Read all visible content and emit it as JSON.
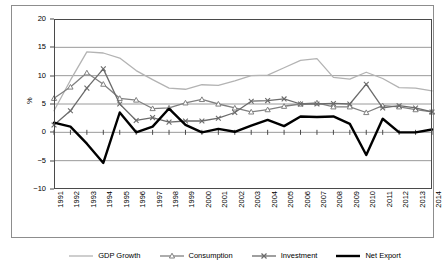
{
  "chart_data": {
    "type": "line",
    "title": "",
    "xlabel": "",
    "ylabel": "%",
    "ylim": [
      -10,
      20
    ],
    "yticks": [
      20,
      15,
      10,
      5,
      0,
      -5,
      -10
    ],
    "grid": true,
    "legend_position": "bottom",
    "categories": [
      "1991",
      "1992",
      "1993",
      "1994",
      "1995",
      "1996",
      "1997",
      "1998",
      "1999",
      "2000",
      "2001",
      "2002",
      "2003",
      "2004",
      "2005",
      "2006",
      "2007",
      "2008",
      "2009",
      "2010",
      "2011",
      "2012",
      "2013",
      "2014"
    ],
    "series": [
      {
        "name": "GDP Growth",
        "color": "#b3b3b3",
        "marker": "none",
        "values": [
          3.8,
          9.2,
          14.2,
          14.0,
          13.1,
          10.9,
          9.3,
          7.8,
          7.6,
          8.4,
          8.3,
          9.1,
          10.0,
          10.1,
          11.4,
          12.7,
          13.0,
          9.7,
          9.4,
          10.6,
          9.5,
          7.9,
          7.8,
          7.3
        ],
        "values_note": "light gray line, no markers"
      },
      {
        "name": "Consumption",
        "color": "#808080",
        "marker": "triangle",
        "values": [
          6.0,
          8.0,
          10.5,
          8.5,
          6.0,
          5.7,
          4.2,
          4.3,
          5.2,
          5.8,
          5.0,
          4.3,
          3.6,
          4.0,
          4.6,
          5.0,
          5.2,
          4.5,
          4.5,
          3.5,
          4.7,
          4.5,
          4.0,
          3.6
        ],
        "values_note": "gray line, open triangle markers"
      },
      {
        "name": "Investment",
        "color": "#6b6b6b",
        "marker": "x",
        "values": [
          1.3,
          3.8,
          7.8,
          11.2,
          5.0,
          2.1,
          2.6,
          1.8,
          2.0,
          2.0,
          2.5,
          3.5,
          5.5,
          5.6,
          5.9,
          5.0,
          5.0,
          5.1,
          5.0,
          8.5,
          4.3,
          4.7,
          4.3,
          3.6
        ],
        "values_note": "dark gray line, x markers"
      },
      {
        "name": "Net Export",
        "color": "#000000",
        "marker": "none",
        "values": [
          1.7,
          1.0,
          -2.0,
          -5.4,
          3.5,
          0.0,
          1.0,
          4.2,
          1.3,
          0.0,
          0.6,
          0.1,
          1.2,
          2.2,
          1.1,
          2.8,
          2.7,
          2.8,
          1.5,
          -4.0,
          2.4,
          0.0,
          0.0,
          0.5
        ],
        "values_note": "thick black line, no markers"
      }
    ]
  }
}
